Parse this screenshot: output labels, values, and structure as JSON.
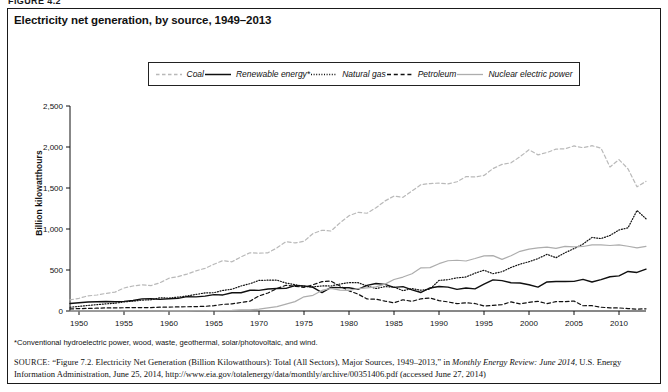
{
  "figure_label": "FIGURE 4.2",
  "chart_title": "Electricity net generation, by source, 1949–2013",
  "axis": {
    "ylabel": "Billion kilowatthours",
    "yticks": [
      "0",
      "500",
      "1,000",
      "1,500",
      "2,000",
      "2,500"
    ],
    "xticks": [
      "1950",
      "1955",
      "1960",
      "1965",
      "1970",
      "1975",
      "1980",
      "1985",
      "1990",
      "1995",
      "2000",
      "2005",
      "2010"
    ]
  },
  "legend": [
    {
      "label": "Coal",
      "style": "dashed",
      "color": "#b9b9b9",
      "name": "coal"
    },
    {
      "label": "Renewable energy*",
      "style": "solid",
      "color": "#101010",
      "name": "renewable-energy"
    },
    {
      "label": "Natural gas",
      "style": "dotted",
      "color": "#101010",
      "name": "natural-gas"
    },
    {
      "label": "Petroleum",
      "style": "dashed",
      "color": "#101010",
      "name": "petroleum"
    },
    {
      "label": "Nuclear electric power",
      "style": "solid",
      "color": "#adadad",
      "name": "nuclear-electric-power"
    }
  ],
  "footnote": "*Conventional hydroelectric power, wood, waste, geothermal, solar/photovoltaic, and wind.",
  "source": {
    "prefix": "SOURCE:",
    "text_1": "“Figure 7.2. Electricity Net Generation (Billion Kilowatthours): Total (All Sectors), Major Sources, 1949–2013,” in ",
    "italic_1": "Monthly Energy Review: June 2014",
    "text_2": ", U.S. Energy Information Administration, June 25, 2014, http://www.eia.gov/totalenergy/data/monthly/archive/00351406.pdf (accessed June 27, 2014)"
  },
  "chart_data": {
    "type": "line",
    "title": "Electricity net generation, by source, 1949–2013",
    "xlabel": "",
    "ylabel": "Billion kilowatthours",
    "xlim": [
      1949,
      2013
    ],
    "ylim": [
      0,
      2500
    ],
    "grid": false,
    "legend_position": "top-center",
    "x": [
      1949,
      1950,
      1951,
      1952,
      1953,
      1954,
      1955,
      1956,
      1957,
      1958,
      1959,
      1960,
      1961,
      1962,
      1963,
      1964,
      1965,
      1966,
      1967,
      1968,
      1969,
      1970,
      1971,
      1972,
      1973,
      1974,
      1975,
      1976,
      1977,
      1978,
      1979,
      1980,
      1981,
      1982,
      1983,
      1984,
      1985,
      1986,
      1987,
      1988,
      1989,
      1990,
      1991,
      1992,
      1993,
      1994,
      1995,
      1996,
      1997,
      1998,
      1999,
      2000,
      2001,
      2002,
      2003,
      2004,
      2005,
      2006,
      2007,
      2008,
      2009,
      2010,
      2011,
      2012,
      2013
    ],
    "series": [
      {
        "name": "Coal",
        "style": "dashed",
        "color": "#b9b9b9",
        "values": [
          135,
          155,
          185,
          195,
          215,
          230,
          280,
          305,
          320,
          310,
          345,
          400,
          420,
          450,
          490,
          520,
          570,
          615,
          600,
          660,
          710,
          705,
          710,
          770,
          845,
          830,
          850,
          945,
          985,
          975,
          1075,
          1162,
          1203,
          1192,
          1259,
          1342,
          1402,
          1386,
          1464,
          1541,
          1554,
          1560,
          1551,
          1576,
          1639,
          1635,
          1653,
          1737,
          1788,
          1807,
          1881,
          1966,
          1904,
          1933,
          1974,
          1978,
          2013,
          1991,
          2016,
          1986,
          1756,
          1847,
          1733,
          1514,
          1581
        ]
      },
      {
        "name": "Renewable energy*",
        "style": "solid",
        "color": "#101010",
        "values": [
          92,
          101,
          109,
          112,
          115,
          113,
          117,
          128,
          148,
          150,
          142,
          150,
          154,
          175,
          172,
          181,
          200,
          196,
          222,
          223,
          253,
          252,
          269,
          275,
          276,
          310,
          307,
          289,
          225,
          287,
          285,
          284,
          264,
          312,
          336,
          325,
          288,
          297,
          258,
          226,
          281,
          299,
          291,
          264,
          280,
          270,
          327,
          380,
          371,
          344,
          341,
          320,
          292,
          354,
          359,
          360,
          361,
          386,
          354,
          382,
          418,
          428,
          482,
          470,
          511
        ]
      },
      {
        "name": "Natural gas",
        "style": "dotted",
        "color": "#101010",
        "values": [
          46,
          56,
          68,
          78,
          87,
          95,
          110,
          120,
          133,
          137,
          161,
          158,
          169,
          183,
          202,
          221,
          223,
          251,
          266,
          305,
          333,
          373,
          376,
          376,
          341,
          320,
          300,
          295,
          306,
          305,
          329,
          346,
          346,
          305,
          274,
          297,
          292,
          248,
          273,
          253,
          267,
          373,
          382,
          404,
          415,
          461,
          497,
          455,
          479,
          531,
          571,
          601,
          639,
          691,
          650,
          710,
          761,
          816,
          897,
          883,
          921,
          988,
          1014,
          1226,
          1125
        ]
      },
      {
        "name": "Petroleum",
        "style": "dashed",
        "color": "#101010",
        "values": [
          25,
          29,
          32,
          34,
          38,
          38,
          40,
          42,
          42,
          41,
          47,
          48,
          50,
          52,
          54,
          57,
          65,
          81,
          87,
          104,
          120,
          184,
          220,
          274,
          314,
          301,
          289,
          320,
          358,
          365,
          304,
          246,
          206,
          147,
          144,
          120,
          100,
          137,
          118,
          149,
          158,
          127,
          111,
          89,
          100,
          91,
          61,
          68,
          78,
          111,
          86,
          106,
          118,
          89,
          115,
          115,
          121,
          64,
          65,
          46,
          38,
          37,
          30,
          23,
          27
        ]
      },
      {
        "name": "Nuclear electric power",
        "style": "solid",
        "color": "#adadad",
        "values": [
          0,
          0,
          0,
          0,
          0,
          0,
          0,
          0,
          0,
          0,
          0,
          1,
          2,
          2,
          3,
          3,
          4,
          6,
          8,
          13,
          14,
          22,
          38,
          54,
          83,
          114,
          173,
          191,
          251,
          276,
          255,
          251,
          273,
          283,
          294,
          328,
          384,
          414,
          455,
          527,
          529,
          577,
          613,
          619,
          610,
          640,
          673,
          675,
          629,
          674,
          728,
          754,
          769,
          780,
          764,
          789,
          782,
          787,
          806,
          806,
          799,
          807,
          790,
          769,
          789
        ]
      }
    ]
  }
}
